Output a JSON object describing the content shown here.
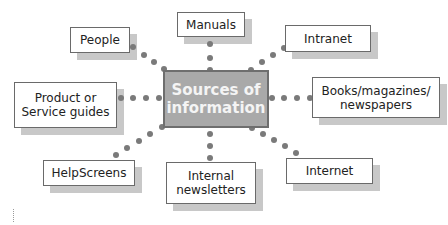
{
  "diagram": {
    "center": {
      "label": "Sources of\ninformation"
    },
    "nodes": [
      {
        "id": "people",
        "label": "People"
      },
      {
        "id": "manuals",
        "label": "Manuals"
      },
      {
        "id": "intranet",
        "label": "Intranet"
      },
      {
        "id": "product-service-guides",
        "label": "Product or\nService guides"
      },
      {
        "id": "books-magazines-newspapers",
        "label": "Books/magazines/\nnewspapers"
      },
      {
        "id": "helpscreens",
        "label": "HelpScreens"
      },
      {
        "id": "internal-newsletters",
        "label": "Internal\nnewsletters"
      },
      {
        "id": "internet",
        "label": "Internet"
      }
    ],
    "colors": {
      "center_fill": "#a9a9a9",
      "center_border": "#6e6e6e",
      "center_text": "#f4f4f4",
      "node_border": "#6a6a6a",
      "shadow": "#c8c8c8",
      "connector_dots": "#7a7a7a"
    }
  }
}
